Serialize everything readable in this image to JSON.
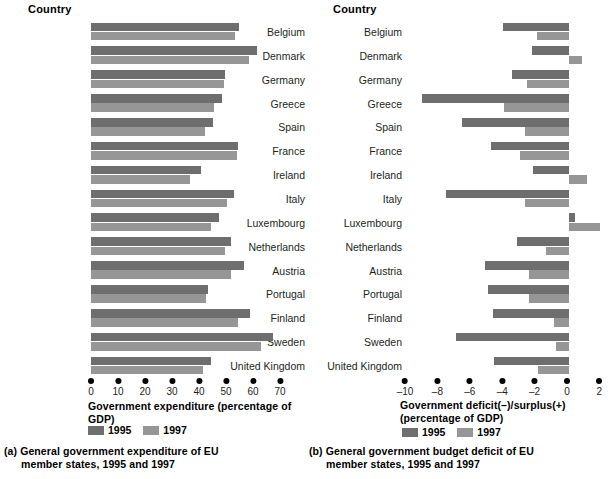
{
  "chart_data": [
    {
      "type": "bar",
      "orientation": "horizontal",
      "title": "(a) General government expenditure of EU member states, 1995 and 1997",
      "column_header": "Country",
      "xlabel": "Government expenditure (percentage of GDP)",
      "ylabel": "Country",
      "xlim": [
        0,
        70
      ],
      "xticks": [
        "0",
        "10",
        "20",
        "30",
        "40",
        "50",
        "60",
        "70"
      ],
      "grid": false,
      "legend_position": "bottom",
      "categories": [
        "Belgium",
        "Denmark",
        "Germany",
        "Greece",
        "Spain",
        "France",
        "Ireland",
        "Italy",
        "Luxembourg",
        "Netherlands",
        "Austria",
        "Portugal",
        "Finland",
        "Sweden",
        "United Kingdom"
      ],
      "series": [
        {
          "name": "1995",
          "color": "#6e6e6e",
          "values": [
            54.8,
            61.5,
            49.5,
            48.6,
            45.0,
            54.3,
            40.8,
            52.9,
            0,
            51.8,
            56.6,
            43.4,
            58.8,
            67.4,
            44.4
          ]
        },
        {
          "name": "1997",
          "color": "#969696",
          "values": [
            53.4,
            58.6,
            49.1,
            45.5,
            42.2,
            54.1,
            36.6,
            50.5,
            0,
            49.7,
            51.9,
            42.5,
            54.4,
            62.8,
            41.3
          ]
        }
      ]
    },
    {
      "type": "bar",
      "orientation": "horizontal",
      "title": "(b) General government budget deficit of EU member states, 1995 and 1997",
      "column_header": "Country",
      "xlabel": "Government deficit(–)/surplus(+) (percentage of GDP)",
      "ylabel": "Country",
      "xlim": [
        -10,
        2
      ],
      "xticks": [
        "–10",
        "–8",
        "–6",
        "–4",
        "–2",
        "0",
        "2"
      ],
      "grid": false,
      "legend_position": "bottom",
      "categories": [
        "Belgium",
        "Denmark",
        "Germany",
        "Spain",
        "Greece",
        "France",
        "Ireland",
        "Italy",
        "Luxembourg",
        "Netherlands",
        "Austria",
        "Portugal",
        "Finland",
        "Sweden",
        "United Kingdom"
      ],
      "series": [
        {
          "name": "1995",
          "color": "#6e6e6e",
          "values": [
            -4.1,
            -2.3,
            -3.5,
            -9.1,
            -6.6,
            -4.8,
            -2.2,
            -7.6,
            0.4,
            -3.2,
            -5.2,
            -5.0,
            -4.7,
            -7.0,
            -4.6
          ]
        },
        {
          "name": "1997",
          "color": "#969696",
          "values": [
            -2.0,
            0.8,
            -2.6,
            -4.0,
            -2.7,
            -3.0,
            1.1,
            -2.7,
            1.9,
            -1.4,
            -2.5,
            -2.5,
            -0.9,
            -0.8,
            -1.9
          ]
        }
      ]
    }
  ],
  "panel_a": {
    "column_header": "Country",
    "axis_title": "Government expenditure (percentage of GDP)",
    "caption_line1": "(a) General government expenditure of EU",
    "caption_line2": "member states, 1995 and 1997",
    "legend": {
      "label_1995": "1995",
      "label_1997": "1997"
    },
    "rows": [
      {
        "country": "Belgium",
        "v1995": 54.8,
        "v1997": 53.4
      },
      {
        "country": "Denmark",
        "v1995": 61.5,
        "v1997": 58.6
      },
      {
        "country": "Germany",
        "v1995": 49.5,
        "v1997": 49.1
      },
      {
        "country": "Greece",
        "v1995": 48.6,
        "v1997": 45.5
      },
      {
        "country": "Spain",
        "v1995": 45.0,
        "v1997": 42.2
      },
      {
        "country": "France",
        "v1995": 54.3,
        "v1997": 54.1
      },
      {
        "country": "Ireland",
        "v1995": 40.8,
        "v1997": 36.6
      },
      {
        "country": "Italy",
        "v1995": 52.9,
        "v1997": 50.5
      },
      {
        "country": "Luxembourg",
        "v1995": 47.4,
        "v1997": 44.4
      },
      {
        "country": "Netherlands",
        "v1995": 51.8,
        "v1997": 49.7
      },
      {
        "country": "Austria",
        "v1995": 56.6,
        "v1997": 51.9
      },
      {
        "country": "Portugal",
        "v1995": 43.4,
        "v1997": 42.5
      },
      {
        "country": "Finland",
        "v1995": 58.8,
        "v1997": 54.4
      },
      {
        "country": "Sweden",
        "v1995": 67.4,
        "v1997": 62.8
      },
      {
        "country": "United Kingdom",
        "v1995": 44.4,
        "v1997": 41.3
      }
    ],
    "xticks": [
      "0",
      "10",
      "20",
      "30",
      "40",
      "50",
      "60",
      "70"
    ]
  },
  "panel_b": {
    "column_header": "Country",
    "axis_title_line1": "Government deficit(–)/surplus(+)",
    "axis_title_line2": "(percentage of GDP)",
    "caption_line1": "(b) General government budget deficit of EU",
    "caption_line2": "member states, 1995 and 1997",
    "legend": {
      "label_1995": "1995",
      "label_1997": "1997"
    },
    "rows": [
      {
        "country": "Belgium",
        "v1995": -4.1,
        "v1997": -2.0
      },
      {
        "country": "Denmark",
        "v1995": -2.3,
        "v1997": 0.8
      },
      {
        "country": "Germany",
        "v1995": -3.5,
        "v1997": -2.6
      },
      {
        "country": "Greece",
        "v1995": -9.1,
        "v1997": -4.0
      },
      {
        "country": "Spain",
        "v1995": -6.6,
        "v1997": -2.7
      },
      {
        "country": "France",
        "v1995": -4.8,
        "v1997": -3.0
      },
      {
        "country": "Ireland",
        "v1995": -2.2,
        "v1997": 1.1
      },
      {
        "country": "Italy",
        "v1995": -7.6,
        "v1997": -2.7
      },
      {
        "country": "Luxembourg",
        "v1995": 0.4,
        "v1997": 1.9
      },
      {
        "country": "Netherlands",
        "v1995": -3.2,
        "v1997": -1.4
      },
      {
        "country": "Austria",
        "v1995": -5.2,
        "v1997": -2.5
      },
      {
        "country": "Portugal",
        "v1995": -5.0,
        "v1997": -2.5
      },
      {
        "country": "Finland",
        "v1995": -4.7,
        "v1997": -0.9
      },
      {
        "country": "Sweden",
        "v1995": -7.0,
        "v1997": -0.8
      },
      {
        "country": "United Kingdom",
        "v1995": -4.6,
        "v1997": -1.9
      }
    ],
    "xticks": [
      "–10",
      "–8",
      "–6",
      "–4",
      "–2",
      "0",
      "2"
    ]
  },
  "colors": {
    "bar_1995": "#6e6e6e",
    "bar_1997": "#969696",
    "text": "#231f20"
  }
}
